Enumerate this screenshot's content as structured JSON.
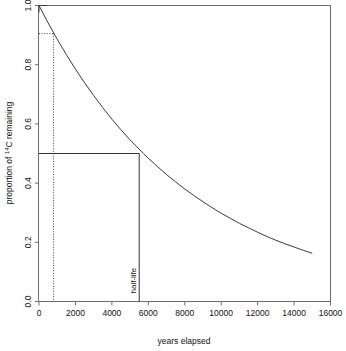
{
  "chart_data": {
    "type": "line",
    "title": "",
    "xlabel": "years elapsed",
    "ylabel_prefix": "proportion of ",
    "ylabel_sup": "14",
    "ylabel_suffix": "C remaining",
    "ylabel_full": "proportion of 14C remaining",
    "xlim": [
      0,
      16000
    ],
    "ylim": [
      0.0,
      1.0
    ],
    "xticks": [
      0,
      2000,
      4000,
      6000,
      8000,
      10000,
      12000,
      14000,
      16000
    ],
    "xticklabels": [
      "0",
      "2000",
      "4000",
      "6000",
      "8000",
      "10000",
      "12000",
      "14000",
      "16000"
    ],
    "yticks": [
      0.0,
      0.2,
      0.4,
      0.6,
      0.8,
      1.0
    ],
    "yticklabels": [
      "0.0",
      "0.2",
      "0.4",
      "0.6",
      "0.8",
      "1.0"
    ],
    "grid": false,
    "legend": "none",
    "curve_label": "exponential decay of carbon-14",
    "half_life_value": 5730,
    "decay_constant": 0.000120968,
    "x": [
      0,
      500,
      1000,
      1500,
      2000,
      2500,
      3000,
      3500,
      4000,
      4500,
      5000,
      5730,
      6000,
      6500,
      7000,
      7500,
      8000,
      8500,
      9000,
      9500,
      10000,
      10500,
      11000,
      11500,
      12000,
      12500,
      13000,
      13500,
      14000,
      14500,
      15000
    ],
    "y": [
      1.0,
      0.941,
      0.886,
      0.834,
      0.785,
      0.739,
      0.696,
      0.655,
      0.616,
      0.58,
      0.546,
      0.5,
      0.484,
      0.456,
      0.429,
      0.404,
      0.38,
      0.358,
      0.337,
      0.317,
      0.298,
      0.281,
      0.264,
      0.249,
      0.234,
      0.22,
      0.207,
      0.195,
      0.184,
      0.173,
      0.163
    ],
    "annotations": [
      {
        "name": "half-life",
        "label": "half-life",
        "x": 5500,
        "y": 0.5,
        "style": "solid",
        "description": "solid guide lines from y-axis at 0.5 down to x-axis at half-life"
      },
      {
        "name": "sample-age",
        "label": "",
        "x": 800,
        "y": 0.905,
        "style": "dotted",
        "description": "dotted guide lines marking a sample reading near 0.9 proportion"
      }
    ],
    "markers": [
      {
        "name": "curve-start-arrow",
        "x": 0,
        "y": 1.0,
        "shape": "arrowhead"
      }
    ]
  }
}
